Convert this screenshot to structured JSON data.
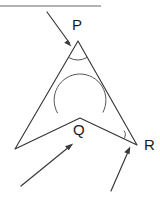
{
  "figure": {
    "background_color": "#ffffff",
    "line_color": "#333333",
    "arc_color": "#555555",
    "pointer_color": "#3a3a3a",
    "rule_color": "#9a9a9a"
  },
  "labels": {
    "p": "P",
    "q": "Q",
    "r": "R"
  },
  "vertices": {
    "p": {
      "name": "P",
      "x": 78,
      "y": 41
    },
    "left": {
      "name": "",
      "x": 15,
      "y": 149
    },
    "q": {
      "name": "Q",
      "x": 80,
      "y": 118
    },
    "r": {
      "name": "R",
      "x": 137,
      "y": 145
    }
  },
  "label_positions": {
    "p": {
      "x": 72,
      "y": 26
    },
    "q": {
      "x": 73,
      "y": 131
    },
    "r": {
      "x": 144,
      "y": 146
    }
  },
  "angle_arcs": [
    {
      "at": "P",
      "type": "interior",
      "radius": 18
    },
    {
      "at": "Q",
      "type": "reflex",
      "radius": 26
    },
    {
      "at": "R",
      "type": "interior",
      "radius": 14
    }
  ],
  "pointers": [
    {
      "name": "pointer-to-p",
      "from_x": 47,
      "from_y": 12,
      "to_x": 71,
      "to_y": 45
    },
    {
      "name": "pointer-to-q",
      "from_x": 21,
      "from_y": 186,
      "to_x": 72,
      "to_y": 144
    },
    {
      "name": "pointer-to-r",
      "from_x": 111,
      "from_y": 191,
      "to_x": 130,
      "to_y": 147
    }
  ],
  "top_rule": {
    "x1": 0,
    "y1": 6,
    "x2": 101,
    "y2": 6
  }
}
